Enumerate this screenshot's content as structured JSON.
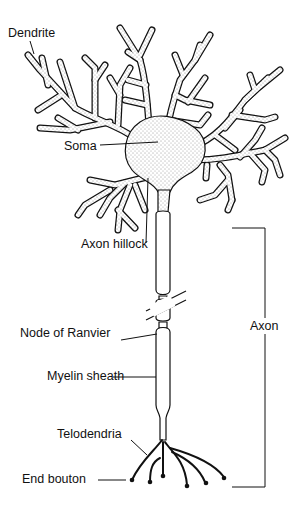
{
  "diagram": {
    "colors": {
      "ink": "#111111",
      "background": "#ffffff",
      "stipple": "#333333"
    },
    "labels": {
      "dendrite": "Dendrite",
      "soma": "Soma",
      "axon_hillock": "Axon hillock",
      "node_of_ranvier": "Node of Ranvier",
      "myelin_sheath": "Myelin sheath",
      "telodendria": "Telodendria",
      "end_bouton": "End bouton",
      "axon": "Axon"
    }
  }
}
